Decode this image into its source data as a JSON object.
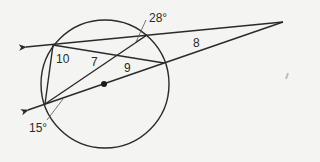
{
  "diagram": {
    "type": "circle-secants-chords",
    "circle": {
      "center": [
        105,
        84
      ],
      "radius": 64,
      "center_dot": true
    },
    "external_point": [
      283,
      22
    ],
    "labels": {
      "angle_top": "28°",
      "angle_bottom": "15°",
      "segment_external": "8",
      "segment_left": "10",
      "segment_middle": "7",
      "segment_right": "9"
    },
    "colors": {
      "stroke": "#2a2a2a",
      "background": "#f4f4f2",
      "text": "#2a2a2a"
    }
  }
}
